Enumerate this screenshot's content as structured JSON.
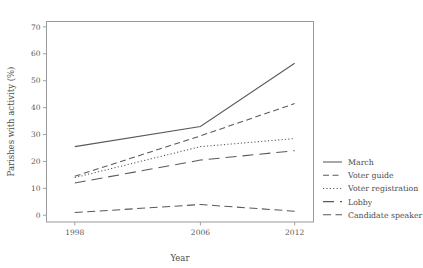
{
  "chart_data": {
    "type": "line",
    "title": "",
    "xlabel": "Year",
    "ylabel": "Parishes with activity (%)",
    "x": [
      1998,
      2006,
      2012
    ],
    "xticklabels": [
      "1998",
      "2006",
      "2012"
    ],
    "xlim": [
      1996.2,
      2013.2
    ],
    "ylim": [
      -2.5,
      72
    ],
    "yticks": [
      0,
      10,
      20,
      30,
      40,
      50,
      60,
      70
    ],
    "yticklabels": [
      "0",
      "10",
      "20",
      "30",
      "40",
      "50",
      "60",
      "70"
    ],
    "grid": false,
    "legend_position": "right",
    "frame": true,
    "series": [
      {
        "name": "March",
        "values": [
          25.5,
          33.0,
          56.5
        ],
        "linestyle": "solid",
        "dasharray": "",
        "color": "#595959"
      },
      {
        "name": "Voter guide",
        "values": [
          14.5,
          29.5,
          41.5
        ],
        "linestyle": "dashed",
        "dasharray": "6,3.5",
        "color": "#595959"
      },
      {
        "name": "Voter registration",
        "values": [
          14.0,
          25.5,
          28.5
        ],
        "linestyle": "dotted",
        "dasharray": "1.2,2.2",
        "color": "#595959"
      },
      {
        "name": "Lobby",
        "values": [
          12.0,
          20.5,
          24.0
        ],
        "linestyle": "long-dash-gap",
        "dasharray": "11,6",
        "color": "#595959"
      },
      {
        "name": "Candidate speaker",
        "values": [
          1.0,
          4.0,
          1.5
        ],
        "linestyle": "long-dash",
        "dasharray": "8,4.5",
        "color": "#595959"
      }
    ]
  },
  "legend": {
    "items": [
      {
        "label": "March"
      },
      {
        "label": "Voter guide"
      },
      {
        "label": "Voter registration"
      },
      {
        "label": "Lobby"
      },
      {
        "label": "Candidate speaker"
      }
    ]
  },
  "axes": {
    "y_title": "Parishes with activity (%)",
    "x_title": "Year",
    "y_ticks": [
      "70",
      "60",
      "50",
      "40",
      "30",
      "20",
      "10",
      "0"
    ],
    "x_ticks": [
      "1998",
      "2006",
      "2012"
    ]
  }
}
